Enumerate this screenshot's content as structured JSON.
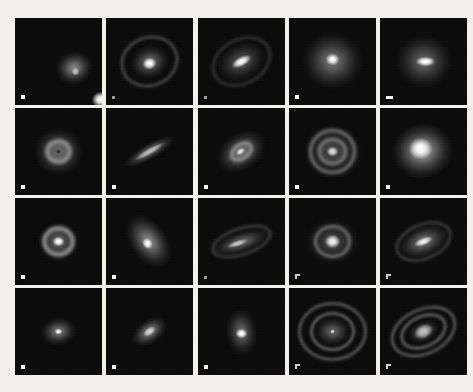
{
  "figure": {
    "type": "image-grid",
    "rows": 4,
    "columns": 5,
    "background_color": "#f2f0ec",
    "panel_background_color": "#080808",
    "panel_size_px": 87,
    "scale_marker_color": "#f2f2f2"
  },
  "panels": [
    {
      "id": "panel-r1c1",
      "row": 1,
      "column": 1,
      "morphology": "elliptical core with small companion",
      "core": {
        "x": 42,
        "y": 38,
        "rx": 9,
        "ry": 8,
        "rot": -15,
        "brightness": "#ffffff"
      },
      "halo": {
        "rx": 19,
        "ry": 17,
        "rot": -20,
        "brightness": "#8d8d8d"
      },
      "companion": {
        "x": 17,
        "y": 10,
        "r": 4,
        "brightness": "#c9c9c9"
      },
      "rings": [],
      "marker": "square"
    },
    {
      "id": "panel-r1c2",
      "row": 1,
      "column": 2,
      "morphology": "bright core with outer oval ring",
      "core": {
        "x": 0,
        "y": 2,
        "rx": 7,
        "ry": 6,
        "rot": -10,
        "brightness": "#ffffff"
      },
      "halo": {
        "rx": 20,
        "ry": 17,
        "rot": -18,
        "brightness": "#757575"
      },
      "rings": [
        {
          "rx": 28,
          "ry": 24,
          "rot": -20,
          "width": 2,
          "brightness": "#6e6e6e"
        }
      ],
      "marker": "tiny"
    },
    {
      "id": "panel-r1c3",
      "row": 1,
      "column": 3,
      "morphology": "barred spiral, tilted bar with faint arms",
      "core": {
        "x": 0,
        "y": 0,
        "rx": 11,
        "ry": 5,
        "rot": -28,
        "brightness": "#ffffff"
      },
      "halo": {
        "rx": 26,
        "ry": 19,
        "rot": -28,
        "brightness": "#5a5a5a"
      },
      "rings": [
        {
          "rx": 30,
          "ry": 22,
          "rot": -28,
          "width": 2,
          "brightness": "#4c4c4c"
        }
      ],
      "marker": "tiny"
    },
    {
      "id": "panel-r1c4",
      "row": 1,
      "column": 4,
      "morphology": "round diffuse halo with bright nucleus",
      "core": {
        "x": 0,
        "y": -2,
        "rx": 7,
        "ry": 6,
        "rot": 0,
        "brightness": "#ffffff"
      },
      "halo": {
        "rx": 31,
        "ry": 29,
        "rot": 0,
        "brightness": "#7a7a7a"
      },
      "rings": [],
      "marker": "square"
    },
    {
      "id": "panel-r1c5",
      "row": 1,
      "column": 5,
      "morphology": "diffuse halo with elongated bright core",
      "core": {
        "x": 2,
        "y": 0,
        "rx": 10,
        "ry": 5,
        "rot": 0,
        "brightness": "#ffffff"
      },
      "halo": {
        "rx": 29,
        "ry": 27,
        "rot": 0,
        "brightness": "#6b6b6b"
      },
      "rings": [],
      "marker": "wide"
    },
    {
      "id": "panel-r2c1",
      "row": 2,
      "column": 1,
      "morphology": "round galaxy with dark nucleus",
      "core": {
        "x": 0,
        "y": 0,
        "rx": 3,
        "ry": 3,
        "rot": 0,
        "brightness": "#2a2a2a"
      },
      "halo": {
        "rx": 25,
        "ry": 24,
        "rot": 0,
        "brightness": "#787878"
      },
      "rings": [
        {
          "rx": 11,
          "ry": 10,
          "rot": 0,
          "width": 5,
          "brightness": "#909090"
        }
      ],
      "marker": "square"
    },
    {
      "id": "panel-r2c2",
      "row": 2,
      "column": 2,
      "morphology": "highly inclined edge-on disk",
      "core": {
        "x": 0,
        "y": 0,
        "rx": 17,
        "ry": 3,
        "rot": -30,
        "brightness": "#b9b9b9"
      },
      "halo": {
        "rx": 29,
        "ry": 8,
        "rot": -30,
        "brightness": "#8a8a8a"
      },
      "rings": [],
      "marker": "square"
    },
    {
      "id": "panel-r2c3",
      "row": 2,
      "column": 3,
      "morphology": "inclined galaxy with inner ring",
      "core": {
        "x": -1,
        "y": 0,
        "rx": 5,
        "ry": 3,
        "rot": -35,
        "brightness": "#e8e8e8"
      },
      "halo": {
        "rx": 27,
        "ry": 19,
        "rot": -35,
        "brightness": "#838383"
      },
      "rings": [
        {
          "rx": 11,
          "ry": 7,
          "rot": -35,
          "width": 3,
          "brightness": "#9c9c9c"
        }
      ],
      "marker": "square"
    },
    {
      "id": "panel-r2c4",
      "row": 2,
      "column": 4,
      "morphology": "concentric ring (bullseye) galaxy",
      "core": {
        "x": 0,
        "y": 0,
        "rx": 6,
        "ry": 5,
        "rot": 0,
        "brightness": "#dcdcdc"
      },
      "halo": {
        "rx": 30,
        "ry": 28,
        "rot": 0,
        "brightness": "#4e4e4e"
      },
      "rings": [
        {
          "rx": 13,
          "ry": 12,
          "rot": 0,
          "width": 4,
          "brightness": "#787878"
        },
        {
          "rx": 22,
          "ry": 21,
          "rot": 0,
          "width": 4,
          "brightness": "#707070"
        }
      ],
      "marker": "square"
    },
    {
      "id": "panel-r2c5",
      "row": 2,
      "column": 5,
      "morphology": "large bright diffuse spheroid",
      "core": {
        "x": -3,
        "y": -3,
        "rx": 12,
        "ry": 11,
        "rot": 0,
        "brightness": "#ffffff"
      },
      "halo": {
        "rx": 31,
        "ry": 28,
        "rot": -10,
        "brightness": "#acacac"
      },
      "rings": [],
      "marker": "square"
    },
    {
      "id": "panel-r3c1",
      "row": 3,
      "column": 1,
      "morphology": "bright nucleus with dark ring and outer ring",
      "core": {
        "x": 0,
        "y": 0,
        "rx": 6,
        "ry": 5,
        "rot": 0,
        "brightness": "#ffffff"
      },
      "halo": {
        "rx": 21,
        "ry": 20,
        "rot": 0,
        "brightness": "#6d6d6d"
      },
      "rings": [
        {
          "rx": 14,
          "ry": 13,
          "rot": 0,
          "width": 5,
          "brightness": "#8f8f8f"
        }
      ],
      "marker": "square"
    },
    {
      "id": "panel-r3c2",
      "row": 3,
      "column": 2,
      "morphology": "inclined spiral with bright nucleus",
      "core": {
        "x": -2,
        "y": 2,
        "rx": 6,
        "ry": 5,
        "rot": 55,
        "brightness": "#ffffff"
      },
      "halo": {
        "rx": 30,
        "ry": 19,
        "rot": 55,
        "brightness": "#909090"
      },
      "rings": [],
      "marker": "square"
    },
    {
      "id": "panel-r3c3",
      "row": 3,
      "column": 3,
      "morphology": "inclined disk with spiral arms",
      "core": {
        "x": -4,
        "y": 2,
        "rx": 11,
        "ry": 3,
        "rot": -18,
        "brightness": "#c6c6c6"
      },
      "halo": {
        "rx": 31,
        "ry": 11,
        "rot": -18,
        "brightness": "#707070"
      },
      "rings": [
        {
          "rx": 30,
          "ry": 13,
          "rot": -18,
          "width": 2,
          "brightness": "#5c5c5c"
        }
      ],
      "marker": "tiny"
    },
    {
      "id": "panel-r3c4",
      "row": 3,
      "column": 4,
      "morphology": "bright bulge with dark gap and outer ring",
      "core": {
        "x": 0,
        "y": 0,
        "rx": 8,
        "ry": 7,
        "rot": 0,
        "brightness": "#f3f3f3"
      },
      "halo": {
        "rx": 28,
        "ry": 24,
        "rot": 0,
        "brightness": "#4a4a4a"
      },
      "rings": [
        {
          "rx": 17,
          "ry": 15,
          "rot": 0,
          "width": 3,
          "brightness": "#7d7d7d"
        }
      ],
      "marker": "cross"
    },
    {
      "id": "panel-r3c5",
      "row": 3,
      "column": 5,
      "morphology": "inclined galaxy with bright bar and outer spiral",
      "core": {
        "x": 0,
        "y": 0,
        "rx": 10,
        "ry": 4,
        "rot": -22,
        "brightness": "#f0f0f0"
      },
      "halo": {
        "rx": 27,
        "ry": 16,
        "rot": -22,
        "brightness": "#7b7b7b"
      },
      "rings": [
        {
          "rx": 28,
          "ry": 17,
          "rot": -22,
          "width": 2,
          "brightness": "#5a5a5a"
        }
      ],
      "marker": "cross"
    },
    {
      "id": "panel-r4c1",
      "row": 4,
      "column": 1,
      "morphology": "small diffuse ellipse with point nucleus",
      "core": {
        "x": 0,
        "y": 0,
        "rx": 4,
        "ry": 3,
        "rot": 0,
        "brightness": "#f7f7f7"
      },
      "halo": {
        "rx": 18,
        "ry": 14,
        "rot": -8,
        "brightness": "#808080"
      },
      "rings": [],
      "marker": "square"
    },
    {
      "id": "panel-r4c2",
      "row": 4,
      "column": 2,
      "morphology": "tilted elliptical galaxy",
      "core": {
        "x": 0,
        "y": 0,
        "rx": 7,
        "ry": 4,
        "rot": -35,
        "brightness": "#d6d6d6"
      },
      "halo": {
        "rx": 20,
        "ry": 12,
        "rot": -35,
        "brightness": "#8d8d8d"
      },
      "rings": [],
      "marker": "square"
    },
    {
      "id": "panel-r4c3",
      "row": 4,
      "column": 3,
      "morphology": "bright nucleus with faint vertical oval halo",
      "core": {
        "x": 0,
        "y": 2,
        "rx": 6,
        "ry": 5,
        "rot": 0,
        "brightness": "#ffffff"
      },
      "halo": {
        "rx": 16,
        "ry": 24,
        "rot": -5,
        "brightness": "#6f6f6f"
      },
      "rings": [],
      "marker": "square"
    },
    {
      "id": "panel-r4c4",
      "row": 4,
      "column": 4,
      "morphology": "double concentric ring galaxy with stellar nucleus",
      "core": {
        "x": 0,
        "y": 0,
        "rx": 2,
        "ry": 2,
        "rot": 0,
        "brightness": "#ffffff"
      },
      "halo": {
        "rx": 18,
        "ry": 15,
        "rot": 0,
        "brightness": "#6a6a6a"
      },
      "rings": [
        {
          "rx": 21,
          "ry": 18,
          "rot": 0,
          "width": 2,
          "brightness": "#9c9c9c"
        },
        {
          "rx": 33,
          "ry": 28,
          "rot": 0,
          "width": 2,
          "brightness": "#8a8a8a"
        }
      ],
      "marker": "cross"
    },
    {
      "id": "panel-r4c5",
      "row": 4,
      "column": 5,
      "morphology": "inclined double ring galaxy",
      "core": {
        "x": 0,
        "y": 0,
        "rx": 10,
        "ry": 7,
        "rot": -25,
        "brightness": "#bcbcbc"
      },
      "halo": {
        "rx": 16,
        "ry": 11,
        "rot": -25,
        "brightness": "#777777"
      },
      "rings": [
        {
          "rx": 23,
          "ry": 15,
          "rot": -25,
          "width": 2,
          "brightness": "#9a9a9a"
        },
        {
          "rx": 33,
          "ry": 22,
          "rot": -25,
          "width": 2,
          "brightness": "#8b8b8b"
        }
      ],
      "marker": "cross"
    }
  ]
}
